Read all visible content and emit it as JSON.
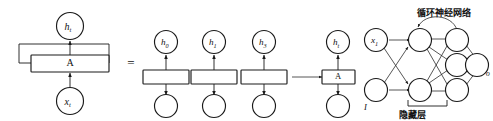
{
  "figure": {
    "background_color": "#ffffff",
    "stroke_color": "#1a1a1a"
  },
  "left_panel": {
    "name": "folded-rnn-cell",
    "output_node_label": "h",
    "output_node_subscript": "t",
    "cell_label": "A",
    "input_node_label": "x",
    "input_node_subscript": "t",
    "recurrent_loop": "self-loop"
  },
  "equals": {
    "symbol": "="
  },
  "unrolled_panel": {
    "name": "unrolled-rnn-steps",
    "steps": [
      {
        "id": "step-0",
        "top_label": "h",
        "top_subscript": "0",
        "cell_label": "",
        "bottom_label": ""
      },
      {
        "id": "step-1",
        "top_label": "h",
        "top_subscript": "1",
        "cell_label": "",
        "bottom_label": ""
      },
      {
        "id": "step-2",
        "top_label": "h",
        "top_subscript": "3",
        "cell_label": "",
        "bottom_label": ""
      },
      {
        "id": "step-t",
        "top_label": "h",
        "top_subscript": "t",
        "cell_label": "A",
        "bottom_label": ""
      }
    ],
    "ellipsis_arrow": "→"
  },
  "network_panel": {
    "name": "recurrent-network-graph",
    "title": "循环神经网络",
    "hidden_layer_label": "隐藏层",
    "input_top_label": "x",
    "input_top_subscript": "1",
    "input_bottom_label": "I",
    "output_label": "O",
    "output_sub_label": "o",
    "layers": {
      "input_count": 2,
      "hidden_left_count": 2,
      "hidden_right_count": 3,
      "output_count": 1
    }
  }
}
